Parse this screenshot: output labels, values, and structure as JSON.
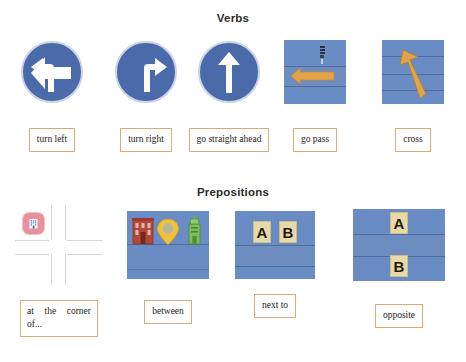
{
  "sections": [
    {
      "title": "Verbs",
      "items": [
        {
          "label": "turn left",
          "icon": "sign-turn-left-icon"
        },
        {
          "label": "turn right",
          "icon": "sign-turn-right-icon"
        },
        {
          "label": "go straight ahead",
          "icon": "sign-go-straight-icon"
        },
        {
          "label": "go pass",
          "icon": "scene-go-pass-icon"
        },
        {
          "label": "cross",
          "icon": "scene-cross-icon"
        }
      ]
    },
    {
      "title": "Prepositions",
      "items": [
        {
          "label": "at the corner of...",
          "icon": "map-intersection-icon"
        },
        {
          "label": "between",
          "icon": "scene-between-icon"
        },
        {
          "label": "next to",
          "icon": "scene-next-to-icon"
        },
        {
          "label": "opposite",
          "icon": "scene-opposite-icon"
        }
      ]
    }
  ],
  "scene_letters": {
    "next_to_a": "A",
    "next_to_b": "B",
    "opposite_a": "A",
    "opposite_b": "B"
  },
  "colors": {
    "sign_blue": "#4a6aaa",
    "sign_rim": "#c9d4e8",
    "scene_blue": "#6a8cc4",
    "arrow_orange": "#e3a34a",
    "chip_border": "#d9ab77",
    "tile_cream": "#e8d9a8",
    "building_red": "#b4473a",
    "pin_yellow": "#f0c03a",
    "tower_green": "#7bbf5a",
    "bldg_icon_pink": "#e8909e",
    "street_gray": "#d8d8d8",
    "heading_text": "#2b2b2b",
    "page_background": "#ffffff"
  }
}
